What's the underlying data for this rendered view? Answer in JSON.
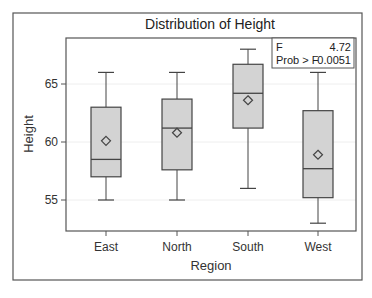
{
  "chart_data": {
    "type": "boxplot",
    "title": "Distribution of Height",
    "xlabel": "Region",
    "ylabel": "Height",
    "ylim": [
      52,
      69.5
    ],
    "yticks": [
      55,
      60,
      65
    ],
    "categories": [
      "East",
      "North",
      "South",
      "West"
    ],
    "series": [
      {
        "name": "East",
        "whisker_low": 55,
        "q1": 57.0,
        "median": 58.5,
        "q3": 63.0,
        "whisker_high": 66,
        "mean": 60.1
      },
      {
        "name": "North",
        "whisker_low": 55,
        "q1": 57.6,
        "median": 61.2,
        "q3": 63.7,
        "whisker_high": 66,
        "mean": 60.8
      },
      {
        "name": "South",
        "whisker_low": 56,
        "q1": 61.2,
        "median": 64.2,
        "q3": 66.7,
        "whisker_high": 68,
        "mean": 63.6
      },
      {
        "name": "West",
        "whisker_low": 53,
        "q1": 55.2,
        "median": 57.7,
        "q3": 62.7,
        "whisker_high": 66,
        "mean": 58.9
      }
    ],
    "inset_stats": {
      "row1_label": "F",
      "row1_value": "4.72",
      "row2_label": "Prob > F",
      "row2_value": "0.0051"
    },
    "grid": "horizontal faint at y ticks",
    "mean_marker": "diamond"
  },
  "colors": {
    "box_fill": "#d3d3d3",
    "line": "#444444",
    "frame": "#555555",
    "grid": "#eeeeee"
  }
}
